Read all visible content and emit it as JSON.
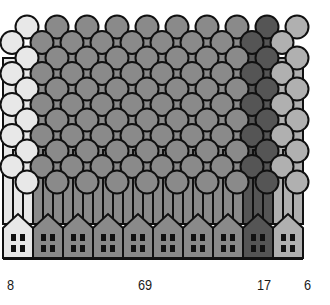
{
  "chart_data": {
    "type": "pictogram",
    "title": "",
    "xlabel": "",
    "ylabel": "",
    "categories": [
      "Category A",
      "Category B",
      "Category C",
      "Category D"
    ],
    "values": [
      8,
      69,
      17,
      6
    ],
    "colors": [
      "#e8e8e8",
      "#8a8a8a",
      "#555555",
      "#b0b0b0"
    ],
    "houses_per_category": [
      1,
      7,
      1,
      1
    ],
    "grid": false,
    "legend": "none"
  },
  "labels": [
    {
      "text": "8",
      "x": 7
    },
    {
      "text": "69",
      "x": 138
    },
    {
      "text": "17",
      "x": 257
    },
    {
      "text": "6",
      "x": 304
    }
  ]
}
